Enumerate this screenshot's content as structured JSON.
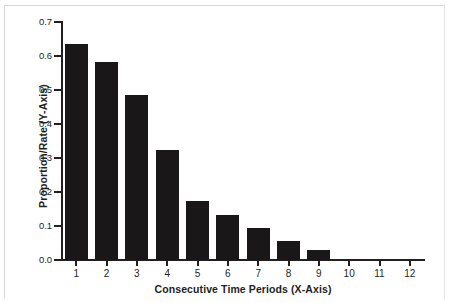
{
  "chart_data": {
    "type": "bar",
    "title": "",
    "xlabel": "Consecutive Time Periods (X-Axis)",
    "ylabel": "Proportion/Rate (Y-Axis)",
    "categories": [
      "1",
      "2",
      "3",
      "4",
      "5",
      "6",
      "7",
      "8",
      "9",
      "10",
      "11",
      "12"
    ],
    "values": [
      0.635,
      0.583,
      0.485,
      0.323,
      0.173,
      0.133,
      0.093,
      0.055,
      0.028,
      0,
      0,
      0
    ],
    "ylim": [
      0.0,
      0.7
    ],
    "ytick_labels": [
      "0.0",
      "0.1",
      "0.2",
      "0.3",
      "0.4",
      "0.5",
      "0.6",
      "0.7"
    ],
    "ytick_values": [
      0.0,
      0.1,
      0.2,
      0.3,
      0.4,
      0.5,
      0.6,
      0.7
    ],
    "xlim": [
      0.5,
      12.5
    ],
    "grid": false,
    "legend": null,
    "bar_color": "#1a1718",
    "axis_color": "#231f20",
    "background_color": "#ffffff"
  }
}
